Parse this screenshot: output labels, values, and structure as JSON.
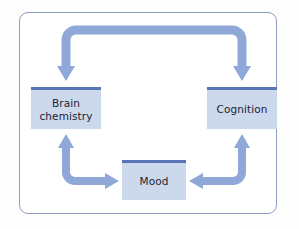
{
  "figure": {
    "type": "cycle-diagram",
    "background_color": "#ffffff",
    "frame_color": "#8e9cc4"
  },
  "palette": {
    "arrow": "#8fa8d8",
    "node_fill": "#ccd8ec",
    "node_top_bar": "#5a75b6",
    "text": "#1d2333"
  },
  "nodes": [
    {
      "id": "brain-chemistry",
      "label": "Brain\nchemistry",
      "line1": "Brain",
      "line2": "chemistry"
    },
    {
      "id": "cognition",
      "label": "Cognition",
      "line1": "Cognition",
      "line2": ""
    },
    {
      "id": "mood",
      "label": "Mood",
      "line1": "Mood",
      "line2": ""
    }
  ],
  "connectors": [
    {
      "id": "top-bracket",
      "shape": "rounded-bracket",
      "from": "cognition",
      "to": "brain-chemistry",
      "heads": "both-down",
      "description": "Top bracket arrow with arrowheads pointing down into Brain chemistry and Cognition"
    },
    {
      "id": "bottom-left-elbow",
      "shape": "elbow",
      "heads": "both",
      "description": "L-shaped arrow pointing up into Brain chemistry and right into Mood"
    },
    {
      "id": "bottom-right-elbow",
      "shape": "elbow",
      "heads": "both",
      "description": "Mirrored L-shaped arrow pointing up into Cognition and left into Mood"
    }
  ]
}
